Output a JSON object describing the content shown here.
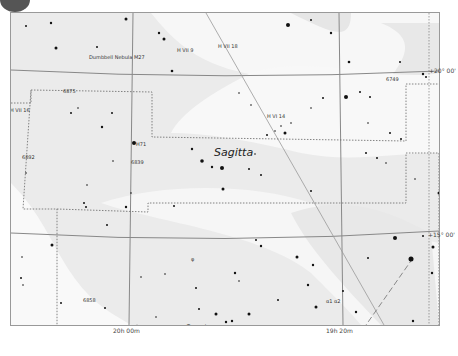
{
  "chart": {
    "constellation_label": "Sagitta",
    "ra_labels": [
      {
        "text": "20h 00m",
        "x": 125
      },
      {
        "text": "19h 20m",
        "x": 333
      }
    ],
    "dec_labels": [
      {
        "text": "+20° 00'",
        "y": 70
      },
      {
        "text": "+15° 00'",
        "y": 234
      }
    ],
    "object_labels": [
      {
        "text": "Dumbbell Nebula M27",
        "x": 88,
        "y": 57
      },
      {
        "text": "H VII 9",
        "x": 176,
        "y": 50
      },
      {
        "text": "H VII 18",
        "x": 217,
        "y": 46
      },
      {
        "text": "6875",
        "x": 62,
        "y": 91
      },
      {
        "text": "H VII 16",
        "x": 9,
        "y": 110
      },
      {
        "text": "6749",
        "x": 385,
        "y": 79
      },
      {
        "text": "H VI 14",
        "x": 266,
        "y": 116
      },
      {
        "text": "H71",
        "x": 135,
        "y": 144
      },
      {
        "text": "6839",
        "x": 130,
        "y": 162
      },
      {
        "text": "6892",
        "x": 21,
        "y": 157
      },
      {
        "text": "φ",
        "x": 190,
        "y": 259
      },
      {
        "text": "6858",
        "x": 82,
        "y": 300
      },
      {
        "text": "Tarazed",
        "x": 186,
        "y": 326
      },
      {
        "text": "α1 α2",
        "x": 325,
        "y": 301
      }
    ]
  }
}
